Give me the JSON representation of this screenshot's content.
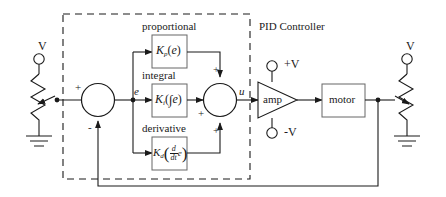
{
  "diagram": {
    "controller_label": "PID Controller",
    "colors": {
      "line": "#1a1a1a",
      "text": "#1a1a1a",
      "background": "#ffffff",
      "dashed_box": "#1a1a1a"
    }
  },
  "blocks": {
    "proportional": {
      "caption": "proportional",
      "gain": "K",
      "gain_sub": "p",
      "expr_open": "(",
      "expr_var": "e",
      "expr_close": ")"
    },
    "integral": {
      "caption": "integral",
      "gain": "K",
      "gain_sub": "i",
      "expr_open": "(",
      "integral_sign": "∫",
      "expr_var": "e",
      "expr_close": ")"
    },
    "derivative": {
      "caption": "derivative",
      "gain": "K",
      "gain_sub": "d",
      "expr_open": "(",
      "frac_num": "d",
      "frac_den": "dt",
      "expr_var": "e",
      "expr_close": ")"
    },
    "amp": {
      "label": "amp",
      "supply_positive": "+V",
      "supply_negative": "-V"
    },
    "motor": {
      "label": "motor"
    }
  },
  "signals": {
    "error": "e",
    "control": "u",
    "sum1_plus": "+",
    "sum1_minus": "-",
    "sum2_plus_top": "+",
    "sum2_plus_left": "+",
    "sum2_plus_bottom": "+"
  },
  "potentiometers": {
    "input": {
      "terminal_label": "V",
      "name": "input-potentiometer"
    },
    "feedback": {
      "terminal_label": "V",
      "name": "feedback-potentiometer"
    }
  }
}
